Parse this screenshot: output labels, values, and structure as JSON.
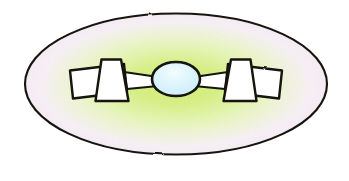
{
  "figure": {
    "canvas": {
      "width": 349,
      "height": 181,
      "background": "#ffffff"
    },
    "outer_ellipse": {
      "name": "outer-ellipse",
      "cx": 176,
      "cy": 84,
      "rx": 152,
      "ry": 71,
      "stroke": "#17120f",
      "stroke_width": 2.1,
      "gradient": {
        "type": "radial",
        "center_color": "#d2ef76",
        "mid_color": "#e6f6b4",
        "outer_color": "#f7f0f6",
        "edge_color": "#f6ecf4"
      }
    },
    "core_blob": {
      "name": "core-blob",
      "cx": 176,
      "cy": 79,
      "rx": 24,
      "ry": 17,
      "fill": "#d5f0fb",
      "highlight": "#eefaff",
      "stroke": "#17120f",
      "stroke_width": 2.6
    },
    "left_assembly": {
      "name": "left-wing-assembly",
      "panel": {
        "name": "left-outer-panel",
        "points": "70,70 124,64 127,92 73,98",
        "fill": "#ffffff",
        "stroke": "#17120f",
        "stroke_width": 2.4
      },
      "trapezoid": {
        "name": "left-trapezoid",
        "points": "101,60 121,60 128,101 96,101",
        "fill": "#ffffff",
        "stroke": "#17120f",
        "stroke_width": 2.4
      },
      "connector": {
        "name": "left-connector-band",
        "points": "124,72 156,77 156,86 127,89",
        "fill": "#ffffff",
        "stroke": "#17120f",
        "stroke_width": 2.2
      }
    },
    "right_assembly": {
      "name": "right-wing-assembly",
      "panel": {
        "name": "right-outer-panel",
        "points": "282,70 228,64 225,92 279,98",
        "fill": "#ffffff",
        "stroke": "#17120f",
        "stroke_width": 2.4
      },
      "trapezoid": {
        "name": "right-trapezoid",
        "points": "251,60 231,60 224,101 256,101",
        "fill": "#ffffff",
        "stroke": "#17120f",
        "stroke_width": 2.4
      },
      "connector": {
        "name": "right-connector-band",
        "points": "228,72 196,77 196,86 225,89",
        "fill": "#ffffff",
        "stroke": "#17120f",
        "stroke_width": 2.2
      }
    },
    "labels": {
      "caption": "",
      "axis_labels": [],
      "legend": []
    }
  }
}
